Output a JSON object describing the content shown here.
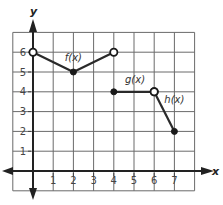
{
  "chart_data": {
    "type": "line",
    "title": "",
    "xlabel": "x",
    "ylabel": "y",
    "xlim": [
      -1,
      8
    ],
    "ylim": [
      -1,
      7
    ],
    "grid": true,
    "x_ticks": [
      1,
      2,
      3,
      4,
      5,
      6,
      7
    ],
    "y_ticks": [
      1,
      2,
      3,
      4,
      5,
      6
    ],
    "series": [
      {
        "name": "f(x)",
        "points": [
          {
            "x": 0,
            "y": 6,
            "endpoint": "open"
          },
          {
            "x": 2,
            "y": 5,
            "endpoint": "closed"
          },
          {
            "x": 4,
            "y": 6,
            "endpoint": "open"
          }
        ],
        "label_pos": {
          "x": 2,
          "y": 5.55
        }
      },
      {
        "name": "g(x)",
        "points": [
          {
            "x": 4,
            "y": 4,
            "endpoint": "closed"
          },
          {
            "x": 6,
            "y": 4,
            "endpoint": "open"
          }
        ],
        "label_pos": {
          "x": 5.05,
          "y": 4.45
        }
      },
      {
        "name": "h(x)",
        "points": [
          {
            "x": 6,
            "y": 4,
            "endpoint": "open"
          },
          {
            "x": 7,
            "y": 2,
            "endpoint": "closed"
          }
        ],
        "label_pos": {
          "x": 7.0,
          "y": 3.45
        }
      }
    ]
  },
  "layout": {
    "origin_px": [
      33,
      171
    ],
    "unit_x_px": 20.2,
    "unit_y_px": 19.8
  }
}
